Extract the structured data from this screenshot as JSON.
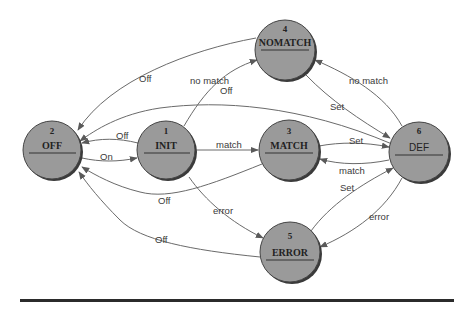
{
  "diagram": {
    "type": "state-machine",
    "nodes": [
      {
        "id": "1",
        "number": "1",
        "name": "INIT",
        "cx": 166,
        "cy": 150
      },
      {
        "id": "2",
        "number": "2",
        "name": "OFF",
        "cx": 52,
        "cy": 150
      },
      {
        "id": "3",
        "number": "3",
        "name": "MATCH",
        "cx": 289,
        "cy": 150
      },
      {
        "id": "4",
        "number": "4",
        "name": "NOMATCH",
        "cx": 285,
        "cy": 50
      },
      {
        "id": "5",
        "number": "5",
        "name": "ERROR",
        "cx": 290,
        "cy": 252
      },
      {
        "id": "6",
        "number": "6",
        "name": "DEF",
        "cx": 419,
        "cy": 152
      }
    ],
    "edges": [
      {
        "from": "OFF",
        "to": "INIT",
        "label": "On"
      },
      {
        "from": "INIT",
        "to": "OFF",
        "label": "Off"
      },
      {
        "from": "INIT",
        "to": "MATCH",
        "label": "match"
      },
      {
        "from": "INIT",
        "to": "NOMATCH",
        "label": "no match"
      },
      {
        "from": "INIT",
        "to": "ERROR",
        "label": "error"
      },
      {
        "from": "NOMATCH",
        "to": "OFF",
        "label": "Off"
      },
      {
        "from": "NOMATCH",
        "to": "DEF",
        "label": "Set"
      },
      {
        "from": "DEF",
        "to": "NOMATCH",
        "label": "no match"
      },
      {
        "from": "DEF",
        "to": "OFF",
        "label": "Off"
      },
      {
        "from": "MATCH",
        "to": "DEF",
        "label": "Set"
      },
      {
        "from": "DEF",
        "to": "MATCH",
        "label": "match"
      },
      {
        "from": "MATCH",
        "to": "OFF",
        "label": "Off"
      },
      {
        "from": "ERROR",
        "to": "DEF",
        "label": "Set"
      },
      {
        "from": "DEF",
        "to": "ERROR",
        "label": "error"
      },
      {
        "from": "ERROR",
        "to": "OFF",
        "label": "Off"
      }
    ]
  },
  "labels": {
    "n1_num": "1",
    "n1_name": "INIT",
    "n2_num": "2",
    "n2_name": "OFF",
    "n3_num": "3",
    "n3_name": "MATCH",
    "n4_num": "4",
    "n4_name": "NOMATCH",
    "n5_num": "5",
    "n5_name": "ERROR",
    "n6_num": "6",
    "n6_name": "DEF",
    "e_on": "On",
    "e_init_off": "Off",
    "e_init_match": "match",
    "e_init_nomatch": "no match",
    "e_init_error": "error",
    "e_nomatch_off": "Off",
    "e_def_off": "Off",
    "e_nomatch_set": "Set",
    "e_def_nomatch": "no match",
    "e_match_set": "Set",
    "e_def_match": "match",
    "e_match_off": "Off",
    "e_error_set": "Set",
    "e_def_error": "error",
    "e_error_off": "Off"
  },
  "colors": {
    "node_fill": "#9a9a9a",
    "edge": "#6a6a6a",
    "rule": "#2b2b2b"
  }
}
